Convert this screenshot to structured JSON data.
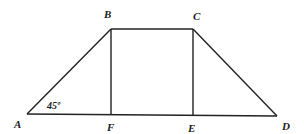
{
  "diagram": {
    "type": "geometry",
    "points": {
      "A": {
        "label": "A",
        "x": 27,
        "y": 114
      },
      "B": {
        "label": "B",
        "x": 111,
        "y": 29
      },
      "C": {
        "label": "C",
        "x": 193,
        "y": 29
      },
      "D": {
        "label": "D",
        "x": 277,
        "y": 116
      },
      "E": {
        "label": "E",
        "x": 193,
        "y": 116
      },
      "F": {
        "label": "F",
        "x": 111,
        "y": 115
      }
    },
    "segments": [
      "AB",
      "BC",
      "CD",
      "AD",
      "BF",
      "CE"
    ],
    "angle_label": "45º",
    "angle_at": "A"
  }
}
